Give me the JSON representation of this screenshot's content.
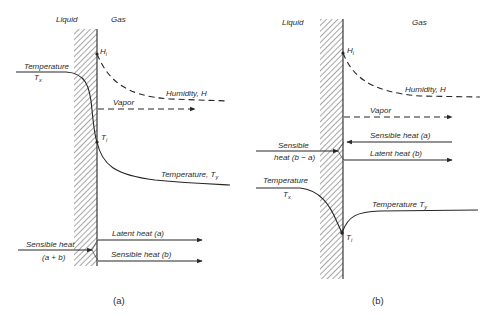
{
  "figure": {
    "panel_a": {
      "caption": "(a)",
      "phase_left": "Liquid",
      "phase_right": "Gas",
      "labels": {
        "humidity_interface": "H",
        "humidity_interface_sub": "i",
        "humidity_bulk": "Humidity, H",
        "vapor": "Vapor",
        "temperature_liquid_title": "Temperature",
        "temperature_liquid": "T",
        "temperature_liquid_sub": "x",
        "temperature_interface": "T",
        "temperature_interface_sub": "i",
        "temperature_gas": "Temperature, T",
        "temperature_gas_sub": "y",
        "latent_heat": "Latent heat (a)",
        "sensible_heat_gas": "Sensible heat (b)",
        "sensible_heat_liquid_line1": "Sensible heat",
        "sensible_heat_liquid_line2": "(a + b)"
      }
    },
    "panel_b": {
      "caption": "(b)",
      "phase_left": "Liquid",
      "phase_right": "Gas",
      "labels": {
        "humidity_interface": "H",
        "humidity_interface_sub": "i",
        "humidity_bulk": "Humidity, H",
        "vapor": "Vapor",
        "sensible_heat_gas": "Sensible heat (a)",
        "latent_heat": "Latent heat (b)",
        "sensible_heat_liquid_line1": "Sensible",
        "sensible_heat_liquid_line2": "heat (b − a)",
        "temperature_liquid_title": "Temperature",
        "temperature_liquid": "T",
        "temperature_liquid_sub": "x",
        "temperature_gas": "Temperature T",
        "temperature_gas_sub": "y",
        "temperature_interface": "T",
        "temperature_interface_sub": "i"
      }
    },
    "colors": {
      "line": "#262626",
      "blue_accent": "#4a4ab0",
      "purple_accent": "#7a4ad0",
      "green_accent": "#3a7a3a",
      "brown_accent": "#8a6a3a"
    }
  }
}
